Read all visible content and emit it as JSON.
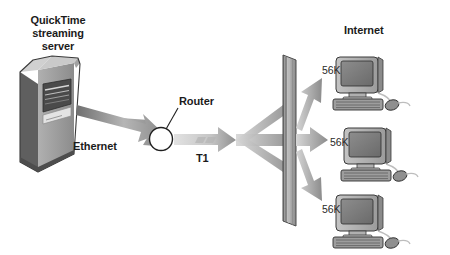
{
  "diagram": {
    "title_source": "QuickTime streaming server",
    "source_label_lines": [
      "QuickTime",
      "streaming",
      "server"
    ],
    "links": {
      "ethernet_label": "Ethernet",
      "t1_label": "T1",
      "router_label": "Router"
    },
    "cloud_label": "Internet",
    "clients": [
      {
        "speed_label": "56K",
        "name": "client-computer-1"
      },
      {
        "speed_label": "56K",
        "name": "client-computer-2"
      },
      {
        "speed_label": "56K",
        "name": "client-computer-3"
      }
    ],
    "colors": {
      "background": "#ffffff",
      "text": "#1b1b1b",
      "arrow_light": "#d9d9d9",
      "arrow_dark": "#8f8f8f",
      "device_face": "#9a9a9a",
      "device_side": "#6f6f6f",
      "device_top": "#c2c2c2",
      "screen": "#7e7e7e",
      "outline": "#2b2b2b"
    }
  }
}
